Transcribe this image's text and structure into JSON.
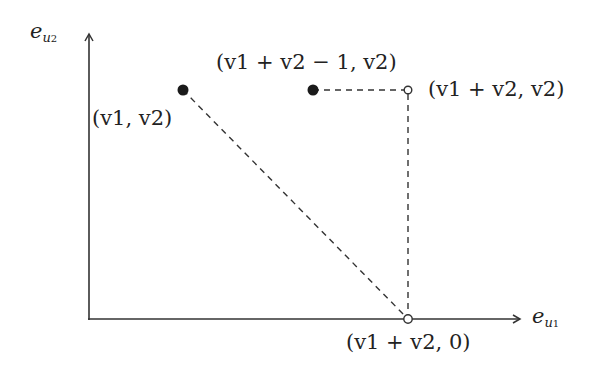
{
  "axes": {
    "x_label": "e_{u1}",
    "y_label": "e_{u2}",
    "x_label_base": "e",
    "x_label_sub_base": "u",
    "x_label_sub_index": "1",
    "y_label_base": "e",
    "y_label_sub_base": "u",
    "y_label_sub_index": "2"
  },
  "points": [
    {
      "id": "p1",
      "label": "(v1, v2)",
      "style": "filled"
    },
    {
      "id": "p2",
      "label": "(v1 + v2 − 1, v2)",
      "style": "filled"
    },
    {
      "id": "p3",
      "label": "(v1 + v2, v2)",
      "style": "open"
    },
    {
      "id": "p4",
      "label": "(v1 + v2, 0)",
      "style": "open"
    }
  ],
  "edges": [
    {
      "from": "p1",
      "to": "p4",
      "style": "dashed"
    },
    {
      "from": "p2",
      "to": "p3",
      "style": "dashed"
    },
    {
      "from": "p3",
      "to": "p4",
      "style": "dashed"
    }
  ],
  "colors": {
    "stroke": "#333333",
    "point": "#1a1a1a",
    "background": "#ffffff"
  }
}
